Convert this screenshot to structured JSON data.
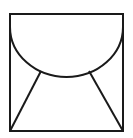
{
  "figure": {
    "icon": "envelope-icon",
    "stroke_color": "#1a1a1a",
    "background": "#ffffff"
  }
}
